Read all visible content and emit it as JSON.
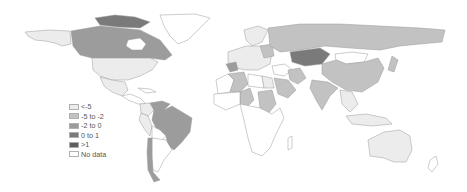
{
  "legend": {
    "items": [
      {
        "label": "<-5",
        "color": "#ececec"
      },
      {
        "label": "-5 to -2",
        "color": "#c2c2c2"
      },
      {
        "label": "-2 to 0",
        "color": "#9c9c9c"
      },
      {
        "label": "0 to 1",
        "color": "#7a7a7a"
      },
      {
        "label": ">1",
        "color": "#5e5e5e"
      },
      {
        "label": "No data",
        "color": "#ffffff"
      }
    ]
  },
  "map": {
    "regions": [
      {
        "name": "Alaska",
        "class": "<-5"
      },
      {
        "name": "Canada",
        "class": "-2 to 0"
      },
      {
        "name": "Canadian Arctic Islands",
        "class": "0 to 1"
      },
      {
        "name": "Greenland",
        "class": "No data"
      },
      {
        "name": "United States",
        "class": "<-5"
      },
      {
        "name": "Mexico",
        "class": "<-5"
      },
      {
        "name": "Central America",
        "class": "No data"
      },
      {
        "name": "Venezuela",
        "class": "-2 to 0"
      },
      {
        "name": "Colombia",
        "class": "<-5"
      },
      {
        "name": "Peru",
        "class": "<-5"
      },
      {
        "name": "Brazil",
        "class": "-2 to 0"
      },
      {
        "name": "Bolivia",
        "class": "No data"
      },
      {
        "name": "Argentina",
        "class": "No data"
      },
      {
        "name": "Chile",
        "class": "-2 to 0"
      },
      {
        "name": "Europe",
        "class": "<-5"
      },
      {
        "name": "Russia",
        "class": "-5 to -2"
      },
      {
        "name": "Kazakhstan",
        "class": "0 to 1"
      },
      {
        "name": "Mongolia",
        "class": "No data"
      },
      {
        "name": "China",
        "class": "-5 to -2"
      },
      {
        "name": "India",
        "class": "-5 to -2"
      },
      {
        "name": "Iran",
        "class": "-5 to -2"
      },
      {
        "name": "Saudi Arabia",
        "class": "-5 to -2"
      },
      {
        "name": "Egypt",
        "class": "<-5"
      },
      {
        "name": "Algeria",
        "class": "-5 to -2"
      },
      {
        "name": "Chad",
        "class": "-5 to -2"
      },
      {
        "name": "Sudan",
        "class": "-5 to -2"
      },
      {
        "name": "Southern Africa",
        "class": "No data"
      },
      {
        "name": "Southeast Asia",
        "class": "<-5"
      },
      {
        "name": "Australia",
        "class": "<-5"
      },
      {
        "name": "New Zealand",
        "class": "No data"
      }
    ]
  }
}
